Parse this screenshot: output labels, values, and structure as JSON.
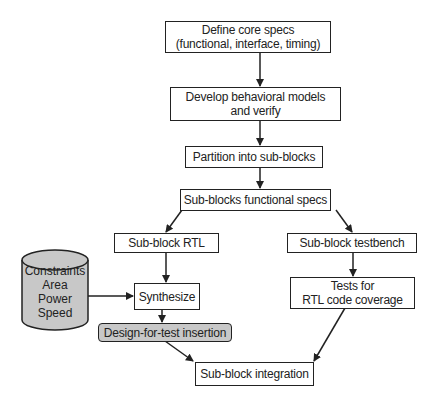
{
  "diagram": {
    "type": "flowchart",
    "colors": {
      "stroke": "#222222",
      "shaded_fill": "#c8c8c8",
      "background": "#ffffff"
    },
    "nodes": {
      "define_specs": {
        "line1": "Define core specs",
        "line2": "(functional, interface, timing)"
      },
      "behavioral_models": {
        "line1": "Develop behavioral models",
        "line2": "and verify"
      },
      "partition": {
        "label": "Partition into sub-blocks"
      },
      "functional_specs": {
        "label": "Sub-blocks functional specs"
      },
      "rtl": {
        "label": "Sub-block RTL"
      },
      "testbench": {
        "label": "Sub-block testbench"
      },
      "synthesize": {
        "label": "Synthesize"
      },
      "dft": {
        "label": "Design-for-test insertion"
      },
      "coverage": {
        "line1": "Tests for",
        "line2": "RTL code coverage"
      },
      "integration": {
        "label": "Sub-block integration"
      },
      "constraints": {
        "line1": "Constraints",
        "line2": "Area",
        "line3": "Power",
        "line4": "Speed"
      }
    },
    "edges": [
      {
        "from": "define_specs",
        "to": "behavioral_models"
      },
      {
        "from": "behavioral_models",
        "to": "partition"
      },
      {
        "from": "partition",
        "to": "functional_specs"
      },
      {
        "from": "functional_specs",
        "to": "rtl"
      },
      {
        "from": "functional_specs",
        "to": "testbench"
      },
      {
        "from": "rtl",
        "to": "synthesize"
      },
      {
        "from": "constraints",
        "to": "synthesize"
      },
      {
        "from": "synthesize",
        "to": "dft"
      },
      {
        "from": "dft",
        "to": "integration"
      },
      {
        "from": "testbench",
        "to": "coverage"
      },
      {
        "from": "coverage",
        "to": "integration"
      }
    ]
  }
}
